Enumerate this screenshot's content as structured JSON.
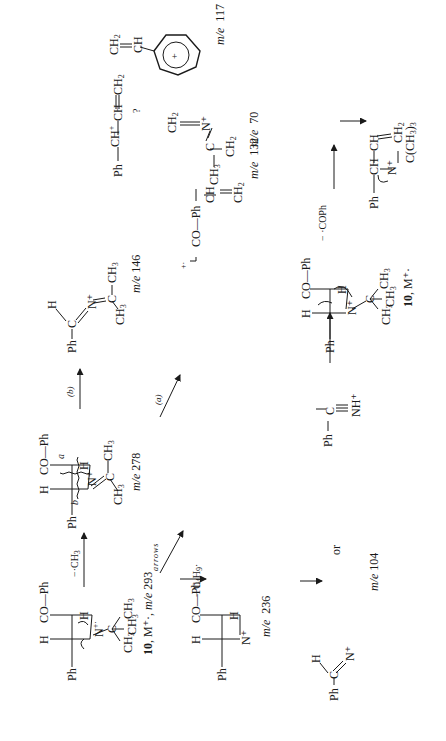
{
  "diagram": {
    "orientation": "rotated 90 degrees counter-clockwise",
    "compounds": {
      "m293": {
        "label_num": "10",
        "label_ion": "M⁺·",
        "mz_text": "m/e 293",
        "groups": [
          "Ph",
          "H",
          "CO—Ph",
          "H",
          "N",
          "C",
          "CH₃",
          "CH₃",
          "CH₃"
        ]
      },
      "m278": {
        "mz_text": "m/e 278",
        "groups": [
          "Ph",
          "H",
          "CO—Ph",
          "H",
          "N⁺",
          "C",
          "CH₃",
          "CH₃"
        ],
        "cleavage_a": "a",
        "cleavage_b": "b"
      },
      "m146": {
        "mz_text": "m/e 146",
        "groups": [
          "Ph",
          "C",
          "H",
          "N⁺",
          "C",
          "CH₃",
          "CH₃"
        ]
      },
      "m70": {
        "mz_text": "m/e  70",
        "groups": [
          "N⁺",
          "CH₂",
          "C",
          "CH₃",
          "CH₂"
        ]
      },
      "m132": {
        "mz_text": "m/e  132",
        "groups": [
          "CO—Ph",
          "CH",
          "CH₂"
        ],
        "charge": "+·"
      },
      "m236": {
        "mz_text": "m/e  236",
        "groups": [
          "Ph",
          "H",
          "CO—Ph",
          "H",
          "N⁺"
        ]
      },
      "m104": {
        "mz_text": "m/e 104",
        "or_text": "or",
        "groups_a": [
          "Ph",
          "C",
          "H",
          "N⁺"
        ],
        "groups_b": [
          "Ph",
          "C",
          "NH⁺"
        ]
      },
      "m10b": {
        "label_num": "10",
        "label_ion": "M⁺·",
        "groups": [
          "Ph",
          "H",
          "CO—Ph",
          "H",
          "N⁺",
          "C",
          "CH₃",
          "CH₃",
          "CH₃"
        ]
      },
      "allyl": {
        "groups": [
          "Ph",
          "CH",
          "CH",
          "CH₂",
          "N⁺",
          "C(CH₃)₃"
        ]
      },
      "cation": {
        "groups": [
          "Ph",
          "CH⁺",
          "CH",
          "CH₂"
        ]
      },
      "m117": {
        "mz_text": "m/e  117",
        "groups": [
          "CH",
          "CH₂",
          "+"
        ]
      }
    },
    "arrows": [
      {
        "from": "m293",
        "to": "m278",
        "label": "−·CH₃"
      },
      {
        "from": "m278",
        "to": "m146",
        "label": "(b)"
      },
      {
        "from": "m278",
        "to": "m70",
        "label": "(a)"
      },
      {
        "from": "m293",
        "to": "m132",
        "label": "arrows"
      },
      {
        "from": "m293",
        "to": "m236",
        "label": "− C₄H₉·"
      },
      {
        "from": "m236",
        "to": "m104",
        "label": ""
      },
      {
        "from": "m10b",
        "to": "allyl",
        "label": "− ·COPh"
      },
      {
        "from": "allyl",
        "to": "cation",
        "label": ""
      },
      {
        "from": "cation",
        "to": "m117",
        "label": "?"
      }
    ]
  }
}
